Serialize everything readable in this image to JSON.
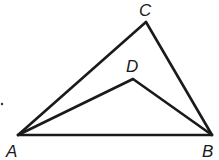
{
  "diagram": {
    "type": "geometry",
    "points": [
      {
        "id": "A",
        "label": "A",
        "x": 18,
        "y": 135,
        "lx": 6,
        "ly": 157
      },
      {
        "id": "B",
        "label": "B",
        "x": 212,
        "y": 135,
        "lx": 202,
        "ly": 157
      },
      {
        "id": "C",
        "label": "C",
        "x": 146,
        "y": 22,
        "lx": 139,
        "ly": 16
      },
      {
        "id": "D",
        "label": "D",
        "x": 133,
        "y": 79,
        "lx": 126,
        "ly": 72
      }
    ],
    "segments": [
      {
        "from": "A",
        "to": "B"
      },
      {
        "from": "A",
        "to": "C"
      },
      {
        "from": "C",
        "to": "B"
      },
      {
        "from": "A",
        "to": "D"
      },
      {
        "from": "D",
        "to": "B"
      }
    ],
    "labels": {
      "A": "A",
      "B": "B",
      "C": "C",
      "D": "D"
    },
    "stray_dot": {
      "x": 2,
      "y": 104
    }
  }
}
